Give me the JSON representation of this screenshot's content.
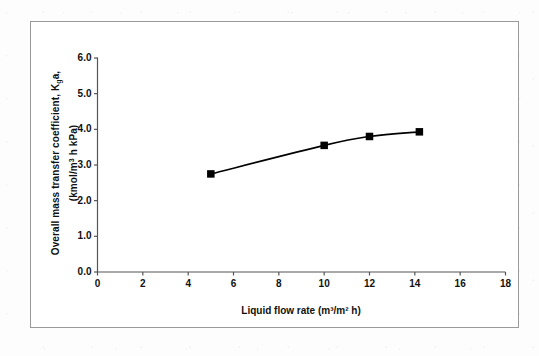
{
  "chart_data": {
    "type": "line",
    "title": "",
    "xlabel": "Liquid flow rate (m³/m² h)",
    "ylabel_line1": "Overall mass transfer coefficient, K",
    "ylabel_line1_sub": "g",
    "ylabel_line1_tail": "a,",
    "ylabel_line2_pre": "(kmol/m",
    "ylabel_line2_sup": "3",
    "ylabel_line2_post": " h kPa)",
    "ylabel": "Overall mass transfer coefficient, K g a, (kmol/m 3 h kPa)",
    "x": [
      5,
      10,
      12,
      14.2
    ],
    "values": [
      2.75,
      3.55,
      3.8,
      3.93
    ],
    "series": [
      {
        "name": "Overall mass transfer coefficient",
        "x": [
          5,
          10,
          12,
          14.2
        ],
        "values": [
          2.75,
          3.55,
          3.8,
          3.93
        ]
      }
    ],
    "xlim": [
      0,
      18
    ],
    "ylim": [
      0,
      6
    ],
    "xticks": [
      0,
      2,
      4,
      6,
      8,
      10,
      12,
      14,
      16,
      18
    ],
    "xtick_labels": [
      "0",
      "2",
      "4",
      "6",
      "8",
      "10",
      "12",
      "14",
      "16",
      "18"
    ],
    "yticks": [
      0,
      1,
      2,
      3,
      4,
      5,
      6
    ],
    "ytick_labels": [
      "0.0",
      "1.0",
      "2.0",
      "3.0",
      "4.0",
      "5.0",
      "6.0"
    ],
    "grid": false,
    "legend": null,
    "marker": "square",
    "marker_color": "#000000",
    "line_color": "#000000",
    "axis_color": "#555555",
    "frame_color": "#9a9a9a",
    "background": "#ffffff"
  }
}
